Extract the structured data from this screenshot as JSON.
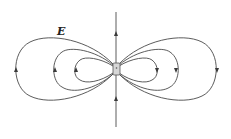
{
  "figure": {
    "field_label": "E",
    "colors": {
      "line": "#4a4a4a",
      "arrow": "#3a3a3a",
      "dipole_fill": "#d6d6d6",
      "background": "#ffffff"
    },
    "lobes": {
      "left": [
        {
          "name": "outer",
          "extent_x": 16
        },
        {
          "name": "middle",
          "extent_x": 55
        },
        {
          "name": "inner",
          "extent_x": 76
        }
      ],
      "right": [
        {
          "name": "inner",
          "extent_x": 157
        },
        {
          "name": "middle",
          "extent_x": 176
        },
        {
          "name": "outer",
          "extent_x": 217
        }
      ]
    },
    "axis_arrows": [
      "up",
      "up"
    ]
  }
}
